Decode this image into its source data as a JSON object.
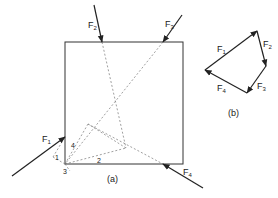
{
  "figure_a": {
    "caption": "(a)",
    "forces": [
      {
        "name": "F",
        "sub": "1"
      },
      {
        "name": "F",
        "sub": "2"
      },
      {
        "name": "F",
        "sub": "3"
      },
      {
        "name": "F",
        "sub": "4"
      }
    ],
    "construction_labels": [
      "4",
      "1",
      "3",
      "2"
    ]
  },
  "figure_b": {
    "caption": "(b)",
    "forces": [
      {
        "name": "F",
        "sub": "1"
      },
      {
        "name": "F",
        "sub": "2"
      },
      {
        "name": "F",
        "sub": "3"
      },
      {
        "name": "F",
        "sub": "4"
      }
    ]
  },
  "colors": {
    "line": "#222222",
    "dashed": "#666666",
    "background": "#ffffff"
  }
}
